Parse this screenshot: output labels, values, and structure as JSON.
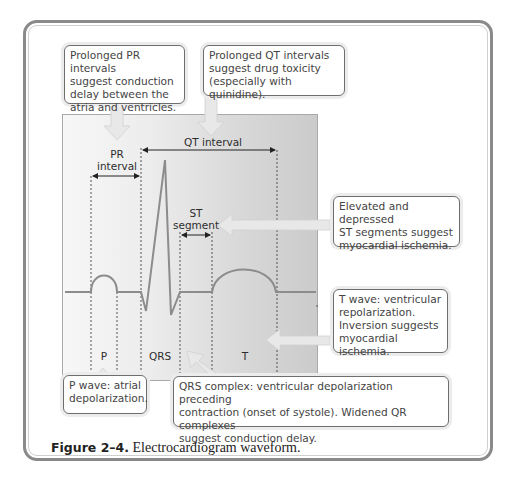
{
  "figure": {
    "caption_label": "Figure 2–4.",
    "caption_text": " Electrocardiogram waveform."
  },
  "diagram_labels": {
    "pr_interval": "PR\ninterval",
    "qt_interval": "QT interval",
    "st_segment": "ST\nsegment",
    "p": "P",
    "qrs": "QRS",
    "t": "T"
  },
  "callouts": {
    "pr": "Prolonged PR intervals\nsuggest conduction\ndelay between the\natria and ventricles.",
    "qt": "Prolonged QT intervals\nsuggest drug toxicity\n(especially with quinidine).",
    "st": "Elevated and depressed\nST segments suggest\nmyocardial ischemia.",
    "t_wave": "T wave: ventricular\nrepolarization.\nInversion suggests\nmyocardial ischemia.",
    "p_wave": "P wave:  atrial\ndepolarization.",
    "qrs": "QRS complex: ventricular depolarization preceding\ncontraction (onset of systole). Widened QR complexes\nsuggest conduction delay."
  },
  "colors": {
    "frame": "#8a8a8a",
    "waveform": "#8c8c8c",
    "arrow_fill": "#e6e6e6",
    "panel_light": "#f7f7f7",
    "panel_dark": "#cbcbcb"
  }
}
